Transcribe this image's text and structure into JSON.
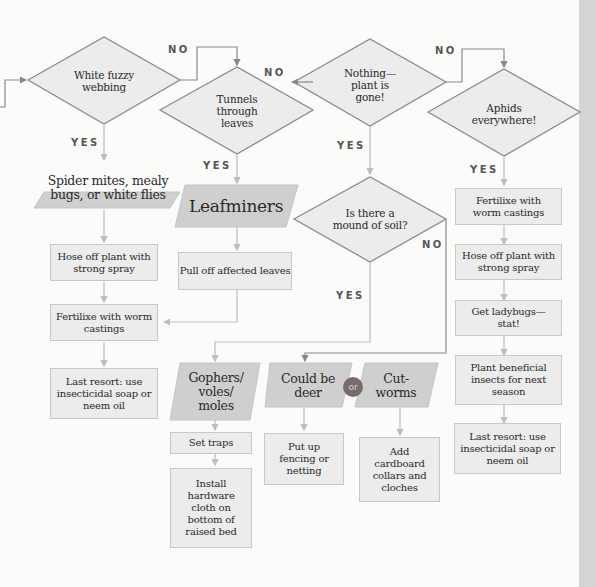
{
  "diagram": {
    "type": "flowchart",
    "colors": {
      "diamond_fill": "#ececec",
      "diamond_stroke": "#8a8a8a",
      "result_fill": "#cfcfcf",
      "box_fill": "#ececec",
      "box_border": "#c8c8c8",
      "or_badge": "#7a6b6b",
      "right_band": "#d4d4d4"
    },
    "questions": [
      {
        "id": "q1",
        "text": "White fuzzy webbing"
      },
      {
        "id": "q2",
        "text": "Tunnels through leaves"
      },
      {
        "id": "q3",
        "text": "Nothing—plant is gone!"
      },
      {
        "id": "q4",
        "text": "Aphids everywhere!"
      },
      {
        "id": "q5",
        "text": "Is there a mound of soil?"
      }
    ],
    "labels": {
      "yes": "YES",
      "no": "NO"
    },
    "results": [
      {
        "id": "r1",
        "text": "Spider mites, mealy bugs, or white flies"
      },
      {
        "id": "r2",
        "text": "Leafminers"
      },
      {
        "id": "r3",
        "text": "Gophers/ voles/ moles"
      },
      {
        "id": "r4",
        "text": "Could be deer"
      },
      {
        "id": "r5",
        "text": "Cut-worms"
      }
    ],
    "or_badge": "or",
    "actions": {
      "spider": [
        "Hose off plant with strong spray",
        "Fertilixe with worm castings",
        "Last resort: use insecticidal soap or neem oil"
      ],
      "leafminers": [
        "Pull off affected leaves"
      ],
      "gophers": [
        "Set traps",
        "Install hardware cloth on bottom of raised bed"
      ],
      "deer": [
        "Put up fencing or netting"
      ],
      "cutworms": [
        "Add cardboard collars and cloches"
      ],
      "aphids": [
        "Fertilixe with worm castings",
        "Hose off plant with strong spray",
        "Get ladybugs—stat!",
        "Plant beneficial insects for next season",
        "Last resort: use insecticidal soap or neem oil"
      ]
    },
    "edges": [
      {
        "from": "q1",
        "to": "q2",
        "label": "NO"
      },
      {
        "from": "q1",
        "to": "r1",
        "label": "YES"
      },
      {
        "from": "q2",
        "to": "q3",
        "label": "NO"
      },
      {
        "from": "q2",
        "to": "r2",
        "label": "YES"
      },
      {
        "from": "q3",
        "to": "q4",
        "label": "NO"
      },
      {
        "from": "q3",
        "to": "q5",
        "label": "YES"
      },
      {
        "from": "q4",
        "to": "aphids.0",
        "label": "YES"
      },
      {
        "from": "q5",
        "to": "r3",
        "label": "YES"
      },
      {
        "from": "q5",
        "to": "r4",
        "label": "NO"
      },
      {
        "from": "leafminers.0",
        "to": "spider.1",
        "label": ""
      }
    ]
  }
}
